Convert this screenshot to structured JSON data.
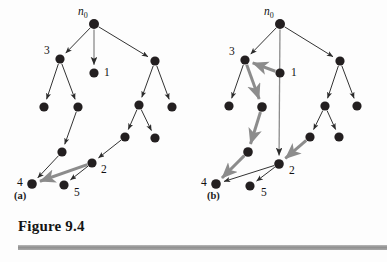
{
  "figure": {
    "title": "Figure 9.4",
    "subtext": "",
    "panels": [
      {
        "id": "a",
        "label": "(a)"
      },
      {
        "id": "b",
        "label": "(b)"
      }
    ]
  },
  "labels": {
    "root": "n",
    "root_sub": "0",
    "one": "1",
    "two": "2",
    "three": "3",
    "four": "4",
    "five": "5"
  },
  "colors": {
    "node_fill": "#231f20",
    "edge_dark": "#333333",
    "edge_gray": "#8c8c8c",
    "rule_gray": "#9a9a9a",
    "text": "#111111",
    "background": "#fdfdfd"
  },
  "panel_a": {
    "nodes": [
      {
        "id": "n0",
        "x": 94,
        "y": 24,
        "r": 5.0,
        "label": "n0"
      },
      {
        "id": "a3",
        "x": 60,
        "y": 59,
        "r": 4.6,
        "label": "3"
      },
      {
        "id": "a1",
        "x": 94,
        "y": 73,
        "r": 4.6,
        "label": "1"
      },
      {
        "id": "aR",
        "x": 155,
        "y": 61,
        "r": 4.6,
        "label": ""
      },
      {
        "id": "aL1",
        "x": 44,
        "y": 107,
        "r": 4.6,
        "label": ""
      },
      {
        "id": "aL2",
        "x": 78,
        "y": 107,
        "r": 4.6,
        "label": ""
      },
      {
        "id": "aRL",
        "x": 139,
        "y": 105,
        "r": 4.6,
        "label": ""
      },
      {
        "id": "aRR",
        "x": 172,
        "y": 107,
        "r": 4.6,
        "label": ""
      },
      {
        "id": "aRLL",
        "x": 125,
        "y": 137,
        "r": 4.6,
        "label": ""
      },
      {
        "id": "aRLR",
        "x": 155,
        "y": 138,
        "r": 4.6,
        "label": ""
      },
      {
        "id": "aM",
        "x": 62,
        "y": 152,
        "r": 4.6,
        "label": ""
      },
      {
        "id": "a2",
        "x": 92,
        "y": 163,
        "r": 4.6,
        "label": "2"
      },
      {
        "id": "a4",
        "x": 32,
        "y": 184,
        "r": 4.8,
        "label": "4"
      },
      {
        "id": "a5",
        "x": 64,
        "y": 185,
        "r": 4.6,
        "label": "5"
      }
    ],
    "edges": [
      {
        "from": "n0",
        "to": "a3",
        "style": "dark"
      },
      {
        "from": "n0",
        "to": "a1",
        "style": "gray"
      },
      {
        "from": "n0",
        "to": "aR",
        "style": "dark"
      },
      {
        "from": "a3",
        "to": "aL1",
        "style": "dark"
      },
      {
        "from": "a3",
        "to": "aL2",
        "style": "dark"
      },
      {
        "from": "aR",
        "to": "aRL",
        "style": "dark"
      },
      {
        "from": "aR",
        "to": "aRR",
        "style": "dark"
      },
      {
        "from": "aRL",
        "to": "aRLL",
        "style": "dark"
      },
      {
        "from": "aRL",
        "to": "aRLR",
        "style": "dark"
      },
      {
        "from": "aL2",
        "to": "aM",
        "style": "dark"
      },
      {
        "from": "aM",
        "to": "a4",
        "style": "dark"
      },
      {
        "from": "aRLL",
        "to": "a2",
        "style": "dark"
      },
      {
        "from": "a2",
        "to": "a4",
        "style": "gray-thick"
      },
      {
        "from": "a2",
        "to": "a5",
        "style": "dark"
      }
    ],
    "text_labels": [
      {
        "text": "n0",
        "x": 78,
        "y": 15,
        "kind": "root"
      },
      {
        "text": "3",
        "x": 44,
        "y": 54,
        "kind": "plain"
      },
      {
        "text": "1",
        "x": 104,
        "y": 76,
        "kind": "plain"
      },
      {
        "text": "2",
        "x": 101,
        "y": 173,
        "kind": "plain"
      },
      {
        "text": "4",
        "x": 17,
        "y": 186,
        "kind": "plain"
      },
      {
        "text": "5",
        "x": 74,
        "y": 196,
        "kind": "plain"
      }
    ]
  },
  "panel_b": {
    "nodes": [
      {
        "id": "n0",
        "x": 280,
        "y": 24,
        "r": 5.0,
        "label": "n0"
      },
      {
        "id": "b3",
        "x": 245,
        "y": 60,
        "r": 4.6,
        "label": "3"
      },
      {
        "id": "b1",
        "x": 280,
        "y": 73,
        "r": 4.6,
        "label": "1"
      },
      {
        "id": "bR",
        "x": 340,
        "y": 61,
        "r": 4.6,
        "label": ""
      },
      {
        "id": "bL1",
        "x": 229,
        "y": 106,
        "r": 4.6,
        "label": ""
      },
      {
        "id": "bL2",
        "x": 262,
        "y": 107,
        "r": 4.8,
        "label": ""
      },
      {
        "id": "bRL",
        "x": 325,
        "y": 106,
        "r": 4.6,
        "label": ""
      },
      {
        "id": "bRR",
        "x": 357,
        "y": 106,
        "r": 4.6,
        "label": ""
      },
      {
        "id": "bRLL",
        "x": 310,
        "y": 137,
        "r": 4.6,
        "label": ""
      },
      {
        "id": "bRLR",
        "x": 339,
        "y": 137,
        "r": 4.6,
        "label": ""
      },
      {
        "id": "bM",
        "x": 248,
        "y": 152,
        "r": 4.8,
        "label": ""
      },
      {
        "id": "b2",
        "x": 279,
        "y": 164,
        "r": 4.8,
        "label": "2"
      },
      {
        "id": "b4",
        "x": 216,
        "y": 184,
        "r": 4.8,
        "label": "4"
      },
      {
        "id": "b5",
        "x": 250,
        "y": 186,
        "r": 4.6,
        "label": "5"
      }
    ],
    "edges": [
      {
        "from": "n0",
        "to": "b3",
        "style": "dark"
      },
      {
        "from": "n0",
        "to": "b2",
        "style": "gray"
      },
      {
        "from": "n0",
        "to": "bR",
        "style": "dark"
      },
      {
        "from": "b1",
        "to": "b3",
        "style": "gray-thick"
      },
      {
        "from": "b3",
        "to": "bL1",
        "style": "dark"
      },
      {
        "from": "b3",
        "to": "bL2",
        "style": "gray-thick"
      },
      {
        "from": "bR",
        "to": "bRL",
        "style": "dark"
      },
      {
        "from": "bR",
        "to": "bRR",
        "style": "dark"
      },
      {
        "from": "bRL",
        "to": "bRLL",
        "style": "dark"
      },
      {
        "from": "bRL",
        "to": "bRLR",
        "style": "dark"
      },
      {
        "from": "bL2",
        "to": "bM",
        "style": "gray-thick"
      },
      {
        "from": "bM",
        "to": "b4",
        "style": "gray-thick"
      },
      {
        "from": "bRLL",
        "to": "b2",
        "style": "gray-thick"
      },
      {
        "from": "b2",
        "to": "b4",
        "style": "dark"
      },
      {
        "from": "b2",
        "to": "b5",
        "style": "dark"
      }
    ],
    "text_labels": [
      {
        "text": "n0",
        "x": 264,
        "y": 15,
        "kind": "root"
      },
      {
        "text": "3",
        "x": 229,
        "y": 55,
        "kind": "plain"
      },
      {
        "text": "1",
        "x": 291,
        "y": 76,
        "kind": "plain"
      },
      {
        "text": "2",
        "x": 289,
        "y": 174,
        "kind": "plain"
      },
      {
        "text": "4",
        "x": 201,
        "y": 186,
        "kind": "plain"
      },
      {
        "text": "5",
        "x": 261,
        "y": 196,
        "kind": "plain"
      }
    ]
  }
}
